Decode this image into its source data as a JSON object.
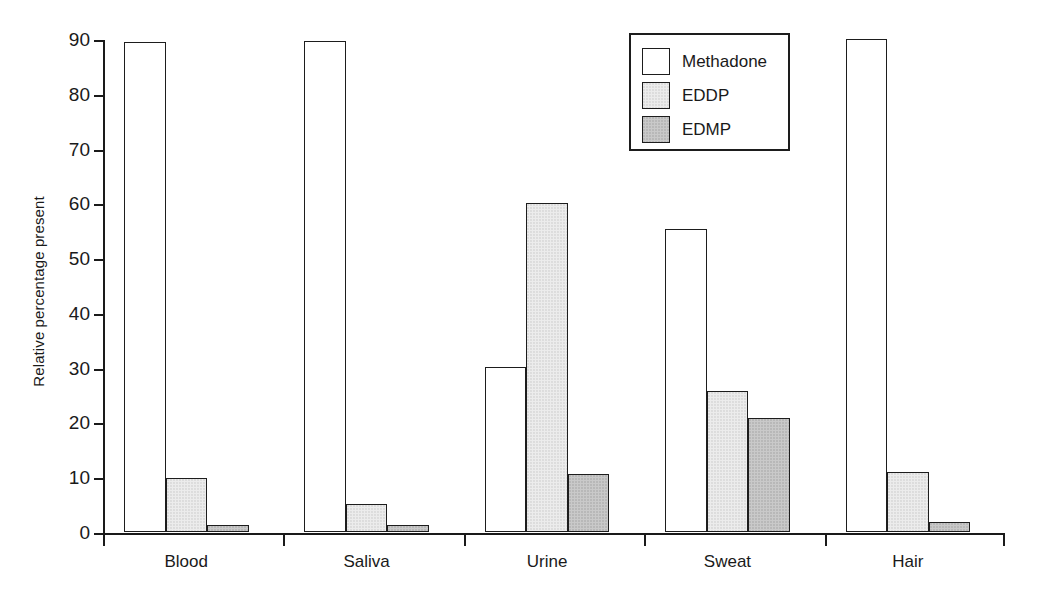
{
  "chart_data": {
    "type": "bar",
    "title": "",
    "subtitle": "",
    "xlabel": "",
    "ylabel": "Relative percentage present",
    "categories": [
      "Blood",
      "Saliva",
      "Urine",
      "Sweat",
      "Hair"
    ],
    "series": [
      {
        "name": "Methadone",
        "color": "#ffffff",
        "values": [
          89.5,
          89.7,
          30.2,
          55.4,
          90.0
        ]
      },
      {
        "name": "EDDP",
        "color": "#ececec",
        "values": [
          9.9,
          5.1,
          60.1,
          25.7,
          10.9
        ]
      },
      {
        "name": "EDMP",
        "color": "#c9c9c9",
        "values": [
          1.2,
          1.3,
          10.5,
          20.8,
          1.9
        ]
      }
    ],
    "ylim": [
      0,
      90
    ],
    "yticks": [
      0,
      10,
      20,
      30,
      40,
      50,
      60,
      70,
      80,
      90
    ],
    "ytick_labels": [
      "0",
      "10",
      "20",
      "30",
      "40",
      "50",
      "60",
      "70",
      "80",
      "90"
    ],
    "grid": false,
    "legend_position": "top-right",
    "legend_entries": [
      "Methadone",
      "EDDP",
      "EDMP"
    ],
    "annotations": []
  },
  "legend": {
    "items": [
      {
        "label": "Methadone"
      },
      {
        "label": "EDDP"
      },
      {
        "label": "EDMP"
      }
    ]
  },
  "axes": {
    "y_title": "Relative percentage present"
  }
}
